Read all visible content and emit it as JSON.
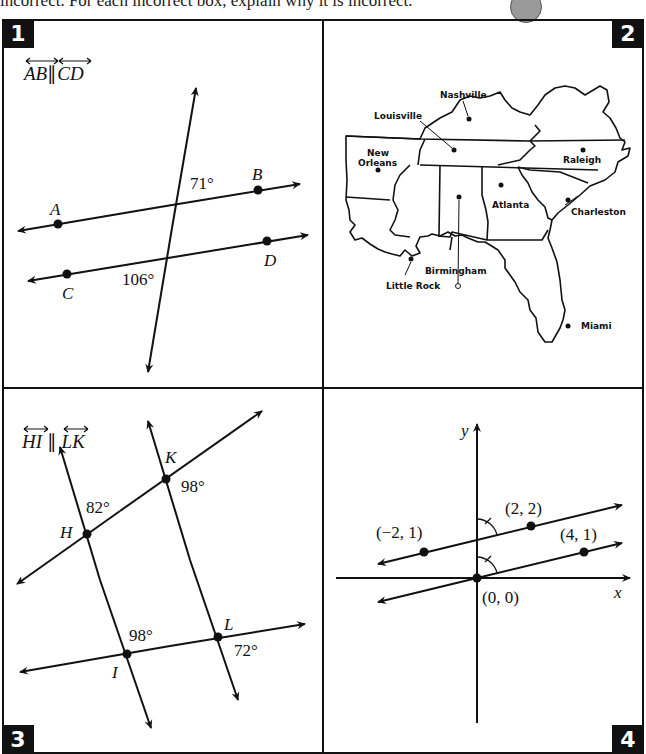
{
  "instructions": "incorrect. For each incorrect box, explain why it is incorrect.",
  "panels": [
    {
      "number": "1",
      "condition": "AB ∥ CD",
      "condition_parts": [
        "AB",
        "CD"
      ],
      "points": {
        "A": "A",
        "B": "B",
        "C": "C",
        "D": "D"
      },
      "angles": [
        "71°",
        "106°"
      ]
    },
    {
      "number": "2",
      "title": "Map of southeastern United States",
      "cities": [
        "Nashville",
        "Louisville",
        "New Orleans",
        "Raleigh",
        "Atlanta",
        "Charleston",
        "Birmingham",
        "Little Rock",
        "Miami"
      ],
      "city_labels": {
        "nashville": "Nashville",
        "louisville": "Louisville",
        "new": "New",
        "orleans": "Orleans",
        "raleigh": "Raleigh",
        "atlanta": "Atlanta",
        "charleston": "Charleston",
        "birmingham": "Birmingham",
        "little_rock": "Little Rock",
        "miami": "Miami"
      }
    },
    {
      "number": "3",
      "condition": "HI ∥ LK",
      "condition_parts": [
        "HI",
        "LK"
      ],
      "points": {
        "H": "H",
        "I": "I",
        "K": "K",
        "L": "L"
      },
      "angles": [
        "82°",
        "98°",
        "98°",
        "72°"
      ]
    },
    {
      "number": "4",
      "axes": {
        "x": "x",
        "y": "y"
      },
      "points": [
        "(−2, 1)",
        "(2, 2)",
        "(4, 1)",
        "(0, 0)"
      ]
    }
  ]
}
